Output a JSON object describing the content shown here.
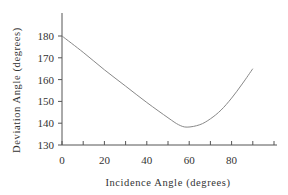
{
  "chart_data": {
    "type": "line",
    "title": "",
    "xlabel": "Incidence Angle (degrees)",
    "ylabel": "Deviation Angle (degrees)",
    "xlim": [
      0,
      105
    ],
    "ylim": [
      130,
      190
    ],
    "xticks": [
      0,
      20,
      40,
      60,
      80
    ],
    "yticks": [
      130,
      140,
      150,
      160,
      170,
      180
    ],
    "grid": false,
    "legend": null,
    "series": [
      {
        "name": "Deviation",
        "color": "#888888",
        "x": [
          0,
          10,
          20,
          30,
          40,
          50,
          55,
          59,
          65,
          70,
          75,
          80,
          85,
          90
        ],
        "y": [
          180,
          172.5,
          164.5,
          157,
          149.5,
          142.5,
          139.3,
          138.2,
          139.3,
          142,
          146,
          151.5,
          158,
          165
        ]
      }
    ]
  }
}
